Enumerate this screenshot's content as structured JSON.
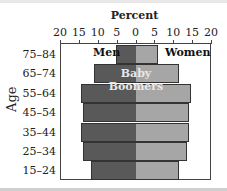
{
  "chart_data": {
    "type": "bar",
    "subtype": "population-pyramid",
    "title": "Percent",
    "xlabel": "Percent",
    "ylabel": "Age",
    "x_ticks": [
      "20",
      "15",
      "10",
      "5",
      "0",
      "5",
      "10",
      "15",
      "20"
    ],
    "xlim": [
      -20,
      20
    ],
    "categories": [
      "75–84",
      "65–74",
      "55–64",
      "45–54",
      "35–44",
      "25–34",
      "15–24"
    ],
    "series": [
      {
        "name": "Men",
        "color": "#595959",
        "values": [
          5.3,
          11,
          14.5,
          14,
          14.5,
          14,
          12
        ]
      },
      {
        "name": "Women",
        "color": "#a6a6a6",
        "values": [
          5.8,
          11.5,
          14.5,
          14,
          14,
          13.5,
          11.5
        ]
      }
    ],
    "legend": [
      "Men",
      "Women"
    ],
    "annotations": [
      {
        "text": "Baby Boomers",
        "near": [
          "65–74",
          "55–64"
        ]
      }
    ],
    "grid": false
  },
  "labels": {
    "title": "Percent",
    "ylabel": "Age",
    "men": "Men",
    "women": "Women",
    "annot_line1": "Baby",
    "annot_line2": "Boomers"
  }
}
